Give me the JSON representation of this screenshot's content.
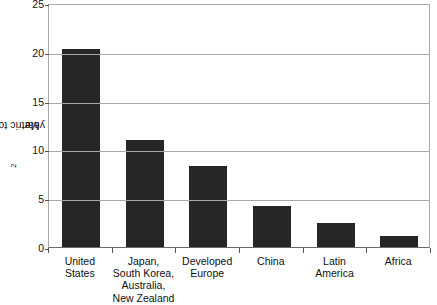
{
  "chart_data": {
    "type": "bar",
    "title": "",
    "xlabel": "",
    "ylabel": "Metric tons of CO2 per year",
    "ylabel_parts": {
      "before": "Metric tons of CO",
      "sub": "2",
      "after": " per year"
    },
    "categories": [
      "United States",
      "Japan, South Korea, Australia, New Zealand",
      "Developed Europe",
      "China",
      "Latin America",
      "Africa"
    ],
    "category_lines": [
      [
        "United",
        "States"
      ],
      [
        "Japan,",
        "South Korea,",
        "Australia,",
        "New Zealand"
      ],
      [
        "Developed",
        "Europe"
      ],
      [
        "China"
      ],
      [
        "Latin",
        "America"
      ],
      [
        "Africa"
      ]
    ],
    "values": [
      20.3,
      11.0,
      8.3,
      4.2,
      2.45,
      1.1
    ],
    "ylim": [
      0,
      25
    ],
    "yticks": [
      0,
      5,
      10,
      15,
      20,
      25
    ],
    "ytick_labels": [
      "0",
      "5",
      "10",
      "15",
      "20",
      "25"
    ],
    "grid": true,
    "legend": "none",
    "bar_color": "#262626",
    "grid_color": "#a8a8a8",
    "axis_color": "#6a6a6a",
    "background": "#ffffff"
  }
}
